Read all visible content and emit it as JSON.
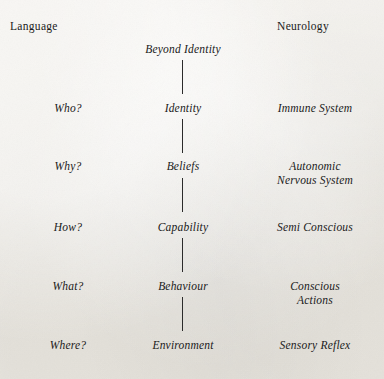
{
  "diagram": {
    "title_visible": false,
    "background_color": "#eae7e0",
    "text_color": "#1a1a1a",
    "line_color": "#2b2b2b",
    "headers": {
      "left": "Language",
      "right": "Neurology"
    },
    "levels": [
      {
        "language": "",
        "level": "Beyond Identity",
        "neurology": "",
        "top": 42
      },
      {
        "language": "Who?",
        "level": "Identity",
        "neurology": "Immune System",
        "top": 101
      },
      {
        "language": "Why?",
        "level": "Beliefs",
        "neurology": "Autonomic\nNervous System",
        "top": 159
      },
      {
        "language": "How?",
        "level": "Capability",
        "neurology": "Semi Conscious",
        "top": 220
      },
      {
        "language": "What?",
        "level": "Behaviour",
        "neurology": "Conscious\nActions",
        "top": 279
      },
      {
        "language": "Where?",
        "level": "Environment",
        "neurology": "Sensory Reflex",
        "top": 338
      }
    ],
    "connectors": [
      {
        "top": 60,
        "height": 34
      },
      {
        "top": 119,
        "height": 34
      },
      {
        "top": 178,
        "height": 34
      },
      {
        "top": 238,
        "height": 34
      },
      {
        "top": 297,
        "height": 34
      }
    ]
  }
}
